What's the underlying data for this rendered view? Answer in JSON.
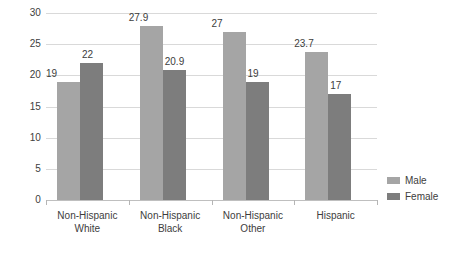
{
  "chart_data": {
    "type": "bar",
    "title": "",
    "subtitle": "",
    "xlabel": "",
    "ylabel": "",
    "categories": [
      "Non-Hispanic White",
      "Non-Hispanic Black",
      "Non-Hispanic Other",
      "Hispanic"
    ],
    "category_lines": [
      [
        "Non-Hispanic",
        "White"
      ],
      [
        "Non-Hispanic",
        "Black"
      ],
      [
        "Non-Hispanic",
        "Other"
      ],
      [
        "Hispanic"
      ]
    ],
    "series": [
      {
        "name": "Male",
        "color": "#a5a5a5",
        "values": [
          19,
          27.9,
          27,
          23.7
        ],
        "labels": [
          "19",
          "27.9",
          "27",
          "23.7"
        ]
      },
      {
        "name": "Female",
        "color": "#7d7d7d",
        "values": [
          22,
          20.9,
          19,
          17
        ],
        "labels": [
          "22",
          "20.9",
          "19",
          "17"
        ]
      }
    ],
    "ylim": [
      0,
      30
    ],
    "yticks": [
      0,
      5,
      10,
      15,
      20,
      25,
      30
    ],
    "ytick_labels": [
      "0",
      "5",
      "10",
      "15",
      "20",
      "25",
      "30"
    ],
    "grid": "horizontal",
    "legend_position": "right"
  },
  "legend": {
    "items": [
      {
        "label": "Male",
        "color": "#a5a5a5"
      },
      {
        "label": "Female",
        "color": "#7d7d7d"
      }
    ]
  }
}
